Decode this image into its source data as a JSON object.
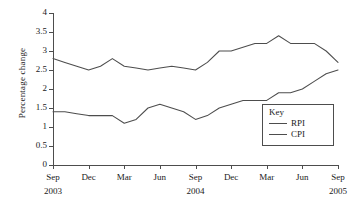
{
  "chart_data": {
    "type": "line",
    "title": "",
    "xlabel": "",
    "ylabel": "Percentage change",
    "ylim": [
      0,
      4
    ],
    "yticks": [
      0,
      0.5,
      1,
      1.5,
      2,
      2.5,
      3,
      3.5,
      4
    ],
    "ytick_labels": [
      "0",
      "0.5",
      "1",
      "1.5",
      "2",
      "2.5",
      "3",
      "3.5",
      "4"
    ],
    "grid": false,
    "legend_position": "inside-bottom-right",
    "legend_title": "Key",
    "xtick_labels": [
      "Sep",
      "Dec",
      "Mar",
      "Jun",
      "Sep",
      "Dec",
      "Mar",
      "Jun",
      "Sep"
    ],
    "xtick_years": [
      "2003",
      "",
      "",
      "",
      "2004",
      "",
      "",
      "",
      "2005"
    ],
    "x": [
      "Sep 2003",
      "Oct 2003",
      "Nov 2003",
      "Dec 2003",
      "Jan 2004",
      "Feb 2004",
      "Mar 2004",
      "Apr 2004",
      "May 2004",
      "Jun 2004",
      "Jul 2004",
      "Aug 2004",
      "Sep 2004",
      "Oct 2004",
      "Nov 2004",
      "Dec 2004",
      "Jan 2005",
      "Feb 2005",
      "Mar 2005",
      "Apr 2005",
      "May 2005",
      "Jun 2005",
      "Jul 2005",
      "Aug 2005",
      "Sep 2005"
    ],
    "series": [
      {
        "name": "RPI",
        "color": "#4d4d4d",
        "values": [
          2.8,
          2.7,
          2.6,
          2.5,
          2.6,
          2.8,
          2.6,
          2.55,
          2.5,
          2.55,
          2.6,
          2.55,
          2.5,
          2.7,
          3.0,
          3.0,
          3.1,
          3.2,
          3.2,
          3.4,
          3.2,
          3.2,
          3.2,
          3.0,
          2.7
        ]
      },
      {
        "name": "CPI",
        "color": "#4d4d4d",
        "values": [
          1.4,
          1.4,
          1.35,
          1.3,
          1.3,
          1.3,
          1.1,
          1.2,
          1.5,
          1.6,
          1.5,
          1.4,
          1.2,
          1.3,
          1.5,
          1.6,
          1.7,
          1.7,
          1.7,
          1.9,
          1.9,
          2.0,
          2.2,
          2.4,
          2.5
        ]
      }
    ]
  },
  "legend": {
    "title": "Key",
    "entries": [
      {
        "label": "RPI"
      },
      {
        "label": "CPI"
      }
    ]
  }
}
